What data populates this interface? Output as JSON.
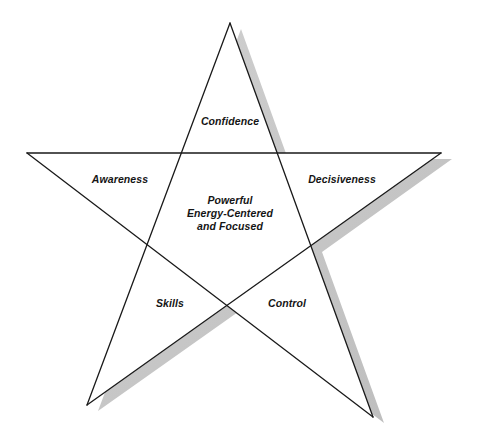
{
  "diagram": {
    "type": "pentagram",
    "colors": {
      "background": "#ffffff",
      "outline": "#1a1a1a",
      "shadow": "#c6c6c6",
      "text": "#151515"
    },
    "shadow_offset": {
      "dx": 11,
      "dy": 6
    },
    "vertices": {
      "top": [
        230,
        23
      ],
      "left": [
        27,
        153
      ],
      "right": [
        441,
        153
      ],
      "bottom_left": [
        87,
        405
      ],
      "bottom_right": [
        373,
        417
      ]
    },
    "points": {
      "shadow": "241,29 288,159 452,159 322,252 384,423 238,312 98,411 158,251 38,159 192,159",
      "outline": "230,23 277,153 441,153 311,246 373,417 227,306 87,405 147,245 27,153 181,153"
    },
    "lines": [
      {
        "from": [
          230,
          23
        ],
        "to": [
          87,
          405
        ]
      },
      {
        "from": [
          230,
          23
        ],
        "to": [
          373,
          417
        ]
      },
      {
        "from": [
          27,
          153
        ],
        "to": [
          441,
          153
        ]
      },
      {
        "from": [
          27,
          153
        ],
        "to": [
          373,
          417
        ]
      },
      {
        "from": [
          441,
          153
        ],
        "to": [
          87,
          405
        ]
      }
    ]
  },
  "labels": {
    "top": "Confidence",
    "left": "Awareness",
    "right": "Decisiveness",
    "bottom_left": "Skills",
    "bottom_right": "Control",
    "center": {
      "line1": "Powerful",
      "line2": "Energy-Centered",
      "line3": "and Focused"
    }
  }
}
